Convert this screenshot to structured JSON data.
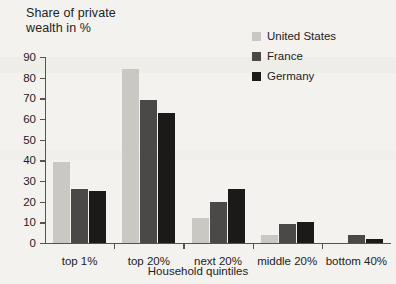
{
  "chart_data": {
    "type": "bar",
    "title": "Share of private wealth in %",
    "title_line1": "Share of private",
    "title_line2": "wealth in %",
    "xlabel": "Household quintiles",
    "ylabel": "Share of private wealth in %",
    "categories": [
      "top 1%",
      "top 20%",
      "next 20%",
      "middle 20%",
      "bottom 40%"
    ],
    "series": [
      {
        "name": "United States",
        "color": "#c9c8c3",
        "values": [
          39,
          84,
          12,
          4,
          0
        ]
      },
      {
        "name": "France",
        "color": "#4a4947",
        "values": [
          26,
          69,
          20,
          9,
          4
        ]
      },
      {
        "name": "Germany",
        "color": "#1b1a18",
        "values": [
          25,
          63,
          26,
          10,
          2
        ]
      }
    ],
    "ylim": [
      0,
      90
    ],
    "yticks": [
      0,
      10,
      20,
      30,
      40,
      50,
      60,
      70,
      80,
      90
    ],
    "ytick_labels": [
      "0",
      "10",
      "20",
      "30",
      "40",
      "50",
      "60",
      "70",
      "80",
      "90"
    ],
    "grid": false,
    "legend_position": "top-right",
    "legend_entries": [
      "United States",
      "France",
      "Germany"
    ]
  },
  "colors": {
    "background": "#f3f2ee",
    "axis": "#55534e",
    "text": "#23211e",
    "united_states": "#c9c8c3",
    "france": "#4a4947",
    "germany": "#1b1a18"
  }
}
